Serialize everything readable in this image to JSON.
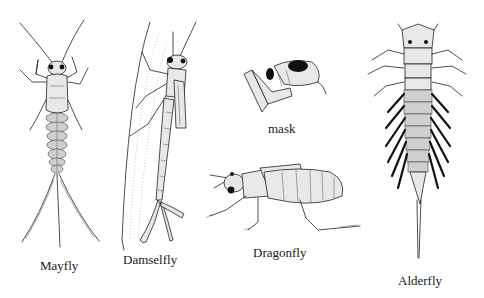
{
  "figure": {
    "specimens": [
      {
        "id": "mayfly",
        "label": "Mayfly"
      },
      {
        "id": "damselfly",
        "label": "Damselfly"
      },
      {
        "id": "mask",
        "label": "mask"
      },
      {
        "id": "dragonfly",
        "label": "Dragonfly"
      },
      {
        "id": "alderfly",
        "label": "Alderfly"
      }
    ]
  },
  "colors": {
    "background": "#ffffff",
    "ink": "#222222"
  }
}
